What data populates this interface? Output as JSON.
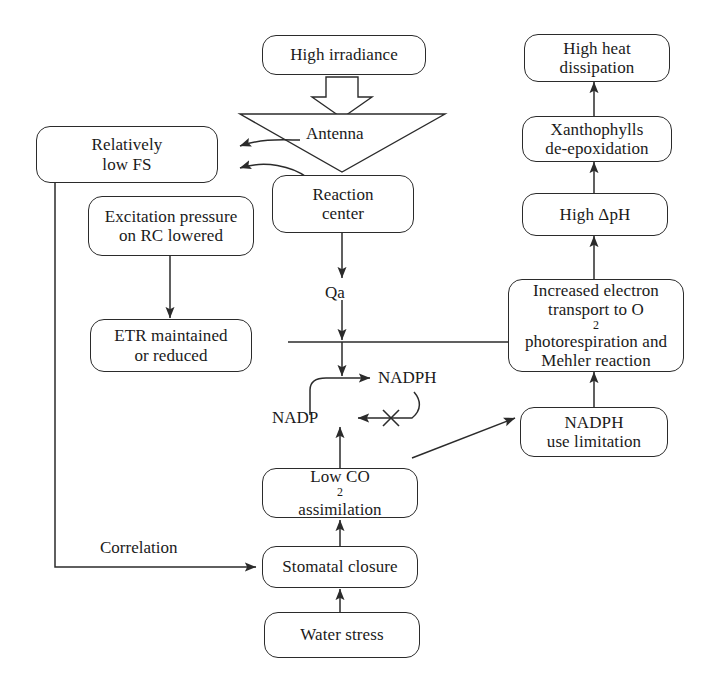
{
  "diagram": {
    "line_color": "#2b2b2b",
    "background": "#ffffff",
    "nodes": [
      {
        "id": "high-irradiance",
        "label": "High irradiance",
        "shape": "rounded-rect"
      },
      {
        "id": "antenna",
        "label": "Antenna",
        "shape": "inverted-triangle"
      },
      {
        "id": "reaction-center",
        "line1": "Reaction",
        "line2": "center",
        "shape": "rounded-rect"
      },
      {
        "id": "relatively-low-fs",
        "line1": "Relatively",
        "line2": "low FS",
        "shape": "rounded-rect"
      },
      {
        "id": "excitation-pressure",
        "line1": "Excitation pressure",
        "line2": "on RC lowered",
        "shape": "rounded-rect"
      },
      {
        "id": "etr-maintained",
        "line1": "ETR maintained",
        "line2": "or reduced",
        "shape": "rounded-rect"
      },
      {
        "id": "qa",
        "label": "Qa",
        "shape": "plain-text"
      },
      {
        "id": "nadph",
        "label": "NADPH",
        "shape": "plain-text"
      },
      {
        "id": "nadp",
        "label": "NADP",
        "shape": "plain-text"
      },
      {
        "id": "low-co2",
        "line1": "Low CO",
        "line1_sub": "2",
        "line2": "assimilation",
        "shape": "rounded-rect"
      },
      {
        "id": "stomatal-closure",
        "label": "Stomatal closure",
        "shape": "rounded-rect"
      },
      {
        "id": "water-stress",
        "label": "Water stress",
        "shape": "rounded-rect"
      },
      {
        "id": "high-heat-dissipation",
        "line1": "High heat",
        "line2": "dissipation",
        "shape": "rounded-rect"
      },
      {
        "id": "xanthophylls",
        "line1": "Xanthophylls",
        "line2": "de-epoxidation",
        "shape": "rounded-rect"
      },
      {
        "id": "high-dph",
        "label": "High ΔpH",
        "shape": "rounded-rect"
      },
      {
        "id": "increased-electron-transport",
        "line1": "Increased electron",
        "line2": "transport to O",
        "line2_sub": "2",
        "line3": "photorespiration and",
        "line4": "Mehler reaction",
        "shape": "rounded-rect"
      },
      {
        "id": "nadph-use-limitation",
        "line1": "NADPH",
        "line2": "use limitation",
        "shape": "rounded-rect"
      }
    ],
    "edge_labels": [
      {
        "id": "correlation",
        "label": "Correlation"
      }
    ],
    "markers": [
      {
        "id": "blocked-x",
        "label": "X",
        "meaning": "blocked-reaction"
      }
    ]
  }
}
